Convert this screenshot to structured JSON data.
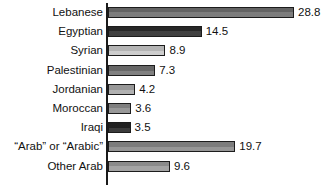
{
  "chart_data": {
    "type": "bar",
    "orientation": "horizontal",
    "title": "",
    "subtitle": "",
    "xlabel": "",
    "ylabel": "",
    "grid": false,
    "legend": "none",
    "xlim": [
      0,
      28.8
    ],
    "axis_line": "category axis at x = 0",
    "categories": [
      "Lebanese",
      "Egyptian",
      "Syrian",
      "Palestinian",
      "Jordanian",
      "Moroccan",
      "Iraqi",
      "“Arab” or “Arabic”",
      "Other Arab"
    ],
    "values": [
      28.8,
      14.5,
      8.9,
      7.3,
      4.2,
      3.6,
      3.5,
      19.7,
      9.6
    ],
    "value_labels": [
      "28.8",
      "14.5",
      "8.9",
      "7.3",
      "4.2",
      "3.6",
      "3.5",
      "19.7",
      "9.6"
    ],
    "bar_colors": [
      "#6e6e6e",
      "#2b2b2b",
      "#c8c8c8",
      "#727272",
      "#a8a8a8",
      "#8d8d8d",
      "#252525",
      "#8a8a8a",
      "#9a9a9a"
    ],
    "bar_outline_color": "#1c1c1c",
    "text_color": "#111111",
    "background_color": "#ffffff"
  },
  "rows": [
    {
      "label": "Lebanese",
      "value": 28.8,
      "value_label": "28.8",
      "color": "#6e6e6e"
    },
    {
      "label": "Egyptian",
      "value": 14.5,
      "value_label": "14.5",
      "color": "#2b2b2b"
    },
    {
      "label": "Syrian",
      "value": 8.9,
      "value_label": "8.9",
      "color": "#c8c8c8"
    },
    {
      "label": "Palestinian",
      "value": 7.3,
      "value_label": "7.3",
      "color": "#727272"
    },
    {
      "label": "Jordanian",
      "value": 4.2,
      "value_label": "4.2",
      "color": "#a8a8a8"
    },
    {
      "label": "Moroccan",
      "value": 3.6,
      "value_label": "3.6",
      "color": "#8d8d8d"
    },
    {
      "label": "Iraqi",
      "value": 3.5,
      "value_label": "3.5",
      "color": "#252525"
    },
    {
      "label": "“Arab” or “Arabic”",
      "value": 19.7,
      "value_label": "19.7",
      "color": "#8a8a8a"
    },
    {
      "label": "Other Arab",
      "value": 9.6,
      "value_label": "9.6",
      "color": "#9a9a9a"
    }
  ],
  "layout": {
    "axis_x_px": 106,
    "bar_start_px": 108,
    "px_per_unit": 6.46,
    "row_pitch_px": 19.2,
    "first_row_top_px": 6,
    "bar_height_px": 11
  }
}
